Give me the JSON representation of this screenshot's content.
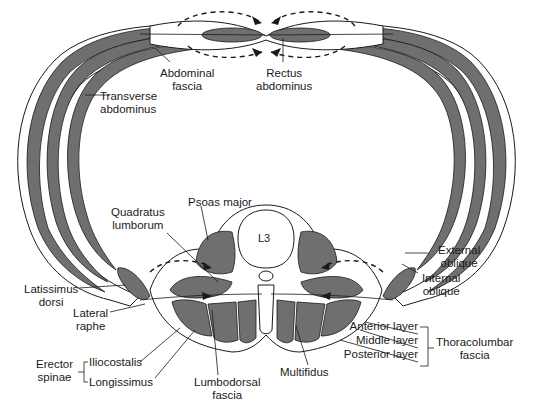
{
  "figure": {
    "vertebra_label": "L3",
    "colors": {
      "muscle": "#6f6f6f",
      "line": "#1a1a1a",
      "background": "#ffffff"
    }
  },
  "labels": {
    "abdominal_fascia": [
      "Abdominal",
      "fascia"
    ],
    "rectus_abdominus": [
      "Rectus",
      "abdominus"
    ],
    "transverse_abdominus": [
      "Transverse",
      "abdominus"
    ],
    "psoas_major": "Psoas major",
    "quadratus_lumborum": [
      "Quadratus",
      "lumborum"
    ],
    "external_oblique": [
      "External",
      "oblique"
    ],
    "internal_oblique": [
      "Internal",
      "oblique"
    ],
    "latissimus_dorsi": [
      "Latissimus",
      "dorsi"
    ],
    "lateral_raphe": [
      "Lateral",
      "raphe"
    ],
    "anterior_layer": "Anterior layer",
    "middle_layer": "Middle layer",
    "posterior_layer": "Posterior layer",
    "thoracolumbar_fascia": [
      "Thoracolumbar",
      "fascia"
    ],
    "erector_spinae": [
      "Erector",
      "spinae"
    ],
    "iliocostalis": "Iliocostalis",
    "longissimus": "Longissimus",
    "lumbodorsal_fascia": [
      "Lumbodorsal",
      "fascia"
    ],
    "multifidus": "Multifidus"
  }
}
